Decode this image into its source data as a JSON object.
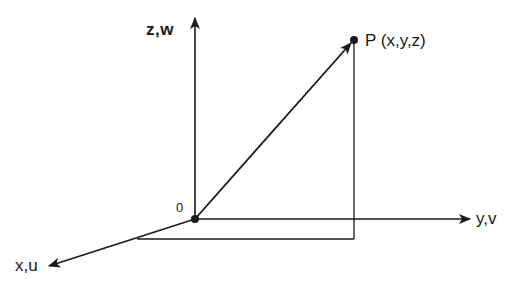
{
  "diagram": {
    "colors": {
      "stroke": "#1a1a1a",
      "background": "#ffffff"
    },
    "labels": {
      "z_axis": "z,w",
      "y_axis": "y,v",
      "x_axis": "x,u",
      "origin": "0",
      "point": "P (x,y,z)"
    },
    "geometry": {
      "origin": [
        195,
        219
      ],
      "z_axis_tip": [
        195,
        16
      ],
      "y_axis_tip": [
        470,
        219
      ],
      "x_axis_tip": [
        47,
        267
      ],
      "point_p": [
        354,
        40
      ],
      "projection_corner": [
        354,
        239
      ],
      "projection_x_intersect": [
        137,
        239
      ]
    }
  }
}
